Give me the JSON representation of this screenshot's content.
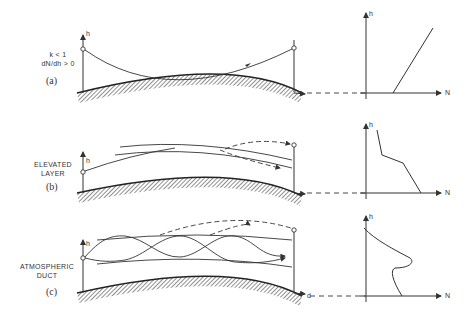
{
  "panels": [
    {
      "id": "a",
      "id_label": "(a)",
      "condition_lines": [
        "k < 1",
        "dN/dh > 0"
      ],
      "profile_description": "N increases linearly with height",
      "y_axis": "h",
      "x_axis": "N"
    },
    {
      "id": "b",
      "id_label": "(b)",
      "condition_lines": [
        "ELEVATED",
        "LAYER"
      ],
      "profile_description": "N decreases sharply in an elevated layer",
      "y_axis": "h",
      "x_axis": "N"
    },
    {
      "id": "c",
      "id_label": "(c)",
      "condition_lines": [
        "ATMOSPHERIC",
        "DUCT"
      ],
      "profile_description": "N has a bulge forming a duct",
      "y_axis": "h",
      "x_axis": "N",
      "distance_label": "d"
    }
  ],
  "colors": {
    "line": "#333333",
    "background": "#ffffff"
  }
}
